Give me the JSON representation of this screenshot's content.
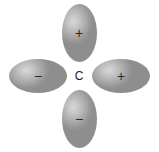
{
  "diagram": {
    "background_color": "#ffffff",
    "center_atom": {
      "label": "C",
      "name": "carbon"
    },
    "lobes": [
      {
        "position": "top",
        "orientation": "vertical",
        "sign": "+",
        "fill_light": "#d8d8d8",
        "fill_dark": "#8e8e8e"
      },
      {
        "position": "right",
        "orientation": "horizontal",
        "sign": "+",
        "fill_light": "#d8d8d8",
        "fill_dark": "#8e8e8e"
      },
      {
        "position": "bottom",
        "orientation": "vertical",
        "sign": "−",
        "fill_light": "#d8d8d8",
        "fill_dark": "#8e8e8e"
      },
      {
        "position": "left",
        "orientation": "horizontal",
        "sign": "−",
        "fill_light": "#d8d8d8",
        "fill_dark": "#8e8e8e"
      }
    ]
  }
}
